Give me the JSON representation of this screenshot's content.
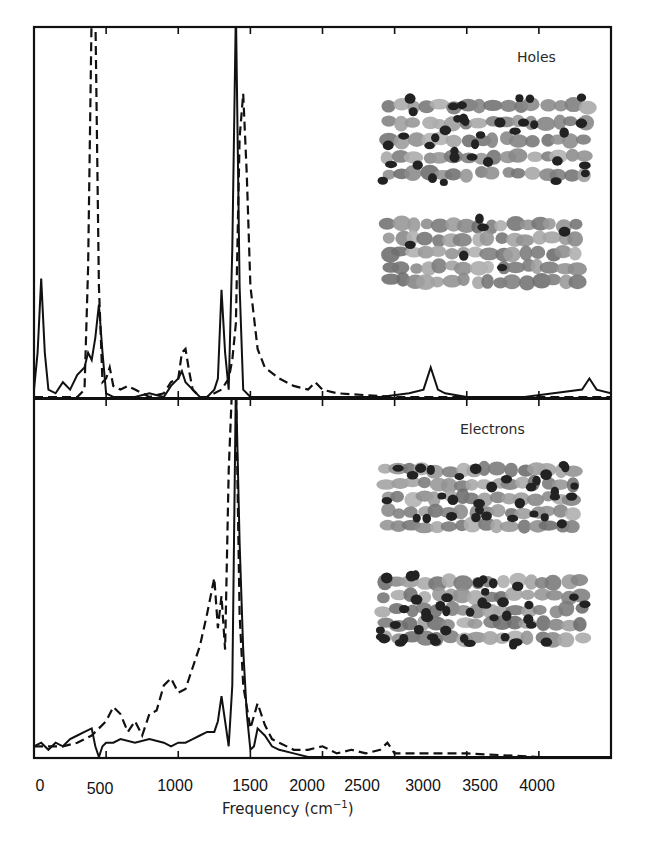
{
  "chart_data": {
    "type": "line",
    "title": "",
    "xlabel": "Frequency (cm⁻¹)",
    "xlabel_parts": {
      "main": "Frequency (cm",
      "sup": "−1",
      "close": ")"
    },
    "ylabel": "",
    "xlim": [
      0,
      4000
    ],
    "xticks": [
      0,
      500,
      1000,
      1500,
      2000,
      2500,
      3000,
      3500,
      4000
    ],
    "xtick_labels": [
      "0",
      "500",
      "1000",
      "1500",
      "2000",
      "2500",
      "3000",
      "3500",
      "4000"
    ],
    "grid": false,
    "legend": "none (solid vs dashed lines, unlabeled)",
    "y_units": "normalized intensity (arbitrary units, 1.0 = panel height)",
    "panels": [
      {
        "name": "Holes",
        "label": "Holes",
        "ylim": [
          0,
          1
        ],
        "series": [
          {
            "name": "solid",
            "style": "solid",
            "x": [
              0,
              25,
              50,
              75,
              100,
              150,
              200,
              250,
              300,
              350,
              375,
              400,
              425,
              450,
              475,
              500,
              550,
              600,
              700,
              800,
              900,
              950,
              1000,
              1025,
              1050,
              1100,
              1150,
              1200,
              1250,
              1275,
              1300,
              1325,
              1350,
              1375,
              1400,
              1425,
              1450,
              1500,
              1600,
              1800,
              2000,
              2200,
              2400,
              2600,
              2700,
              2750,
              2800,
              2850,
              3000,
              3200,
              3400,
              3600,
              3800,
              3850,
              3900,
              4000
            ],
            "y": [
              0.02,
              0.12,
              0.32,
              0.12,
              0.02,
              0.01,
              0.04,
              0.02,
              0.06,
              0.08,
              0.12,
              0.1,
              0.16,
              0.25,
              0.12,
              0.01,
              0.0,
              0.0,
              0.0,
              0.01,
              0.0,
              0.03,
              0.05,
              0.07,
              0.04,
              0.02,
              0.0,
              0.0,
              0.02,
              0.05,
              0.29,
              0.12,
              0.02,
              0.4,
              1.05,
              0.3,
              0.02,
              0.0,
              0.0,
              0.0,
              0.0,
              0.0,
              0.0,
              0.01,
              0.02,
              0.08,
              0.02,
              0.01,
              0.0,
              0.0,
              0.0,
              0.01,
              0.02,
              0.05,
              0.02,
              0.01
            ]
          },
          {
            "name": "dashed",
            "style": "dashed",
            "x": [
              0,
              100,
              200,
              300,
              350,
              375,
              400,
              425,
              450,
              475,
              500,
              525,
              550,
              600,
              650,
              700,
              800,
              900,
              950,
              1000,
              1025,
              1050,
              1075,
              1100,
              1150,
              1200,
              1300,
              1350,
              1375,
              1400,
              1425,
              1450,
              1475,
              1500,
              1550,
              1600,
              1700,
              1800,
              1900,
              1950,
              2000,
              2100,
              2500,
              3000,
              3500,
              4000
            ],
            "y": [
              0.0,
              0.0,
              0.0,
              0.0,
              0.02,
              0.35,
              1.05,
              1.05,
              0.3,
              0.04,
              0.05,
              0.08,
              0.03,
              0.02,
              0.03,
              0.02,
              0.0,
              0.01,
              0.04,
              0.05,
              0.12,
              0.13,
              0.07,
              0.02,
              0.0,
              0.0,
              0.02,
              0.05,
              0.1,
              0.2,
              0.7,
              0.82,
              0.6,
              0.3,
              0.13,
              0.08,
              0.05,
              0.03,
              0.02,
              0.04,
              0.02,
              0.01,
              0.0,
              0.0,
              0.0,
              0.0
            ]
          }
        ]
      },
      {
        "name": "Electrons",
        "label": "Electrons",
        "ylim": [
          0,
          1
        ],
        "series": [
          {
            "name": "solid",
            "style": "solid",
            "x": [
              0,
              50,
              100,
              150,
              200,
              250,
              300,
              350,
              400,
              425,
              450,
              475,
              500,
              550,
              600,
              700,
              800,
              900,
              950,
              1000,
              1050,
              1100,
              1150,
              1200,
              1250,
              1275,
              1300,
              1325,
              1350,
              1375,
              1400,
              1425,
              1450,
              1475,
              1500,
              1525,
              1550,
              1600,
              1650,
              1700,
              1800,
              1900,
              2000,
              2200,
              2500,
              3000,
              3500,
              4000
            ],
            "y": [
              0.03,
              0.04,
              0.02,
              0.04,
              0.03,
              0.05,
              0.06,
              0.07,
              0.08,
              0.03,
              0.0,
              0.03,
              0.04,
              0.04,
              0.05,
              0.04,
              0.05,
              0.04,
              0.03,
              0.04,
              0.04,
              0.05,
              0.06,
              0.07,
              0.07,
              0.1,
              0.17,
              0.1,
              0.03,
              0.2,
              1.05,
              0.6,
              0.3,
              0.12,
              0.02,
              0.03,
              0.08,
              0.06,
              0.03,
              0.02,
              0.01,
              0.0,
              0.0,
              0.0,
              0.0,
              0.0,
              0.0,
              0.0
            ]
          },
          {
            "name": "dashed",
            "style": "dashed",
            "x": [
              0,
              100,
              200,
              300,
              400,
              450,
              500,
              550,
              600,
              650,
              700,
              750,
              800,
              850,
              900,
              950,
              1000,
              1050,
              1100,
              1150,
              1200,
              1225,
              1250,
              1275,
              1300,
              1325,
              1350,
              1375,
              1400,
              1425,
              1450,
              1500,
              1550,
              1600,
              1650,
              1700,
              1800,
              1900,
              2000,
              2100,
              2200,
              2300,
              2400,
              2450,
              2500,
              3000,
              3500,
              4000
            ],
            "y": [
              0.03,
              0.03,
              0.03,
              0.04,
              0.06,
              0.08,
              0.1,
              0.14,
              0.12,
              0.07,
              0.1,
              0.06,
              0.12,
              0.13,
              0.2,
              0.22,
              0.18,
              0.19,
              0.25,
              0.31,
              0.4,
              0.45,
              0.5,
              0.36,
              0.45,
              0.3,
              0.8,
              1.05,
              1.05,
              0.4,
              0.2,
              0.08,
              0.15,
              0.09,
              0.05,
              0.04,
              0.02,
              0.02,
              0.03,
              0.01,
              0.02,
              0.01,
              0.02,
              0.04,
              0.01,
              0.01,
              0.0,
              0.0
            ]
          }
        ]
      }
    ],
    "annotations": [
      "Holes",
      "Electrons"
    ],
    "insets": [
      {
        "panel": "Holes",
        "description": "two molecular orbital isosurface renderings (grey/black lobes) of a nanotube segment"
      },
      {
        "panel": "Electrons",
        "description": "two molecular orbital isosurface renderings (grey/black lobes) of a nanotube segment"
      }
    ]
  }
}
